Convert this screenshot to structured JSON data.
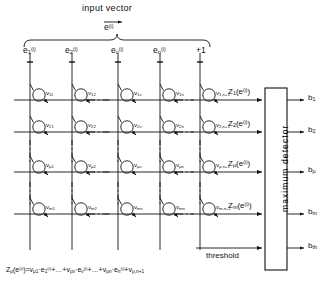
{
  "figure": {
    "title": "input vector",
    "input_vector_symbol": "e",
    "input_vector_sup": "(i)"
  },
  "inputs": [
    {
      "name": "e",
      "sub": "1",
      "sup": "(i)",
      "x": 30
    },
    {
      "name": "e",
      "sub": "2",
      "sup": "(i)",
      "x": 72
    },
    {
      "name": "e",
      "sub": "ν",
      "sup": "(i)",
      "x": 118
    },
    {
      "name": "e",
      "sub": "n",
      "sup": "(i)",
      "x": 160
    },
    {
      "name": "+1",
      "sub": "",
      "sup": "",
      "x": 200
    }
  ],
  "rows": [
    {
      "weights": [
        "v11",
        "v12",
        "v1ν",
        "v1n",
        "v1,n+1"
      ],
      "weight_parts": [
        {
          "base": "v",
          "sub": "11"
        },
        {
          "base": "v",
          "sub": "12"
        },
        {
          "base": "v",
          "sub": "1ν"
        },
        {
          "base": "v",
          "sub": "1n"
        },
        {
          "base": "v",
          "sub": "1,n+1"
        }
      ],
      "z_label": {
        "base": "Z",
        "sub": "1",
        "arg": "(e",
        "sup": "(i)",
        "close": ")"
      },
      "output": {
        "base": "b",
        "sub": "1"
      }
    },
    {
      "weight_parts": [
        {
          "base": "v",
          "sub": "21"
        },
        {
          "base": "v",
          "sub": "22"
        },
        {
          "base": "v",
          "sub": "2ν"
        },
        {
          "base": "v",
          "sub": "2n"
        },
        {
          "base": "v",
          "sub": "2,n+1"
        }
      ],
      "z_label": {
        "base": "Z",
        "sub": "2",
        "arg": "(e",
        "sup": "(i)",
        "close": ")"
      },
      "output": {
        "base": "b",
        "sub": "2"
      }
    },
    {
      "weight_parts": [
        {
          "base": "v",
          "sub": "μ1"
        },
        {
          "base": "v",
          "sub": "μ2"
        },
        {
          "base": "v",
          "sub": "μν"
        },
        {
          "base": "v",
          "sub": "μn"
        },
        {
          "base": "v",
          "sub": "μ,n+1"
        }
      ],
      "z_label": {
        "base": "Z",
        "sub": "μ",
        "arg": "(e",
        "sup": "(i)",
        "close": ")"
      },
      "output": {
        "base": "b",
        "sub": "μ"
      }
    },
    {
      "weight_parts": [
        {
          "base": "v",
          "sub": "m1"
        },
        {
          "base": "v",
          "sub": "m2"
        },
        {
          "base": "v",
          "sub": "mν"
        },
        {
          "base": "v",
          "sub": "mn"
        },
        {
          "base": "v",
          "sub": "m,n+1"
        }
      ],
      "z_label": {
        "base": "Z",
        "sub": "m",
        "arg": "(e",
        "sup": "(i)",
        "close": ")"
      },
      "output": {
        "base": "b",
        "sub": "m"
      }
    }
  ],
  "detector": {
    "label": "maximum detector"
  },
  "threshold": {
    "label": "threshold",
    "output": {
      "base": "b",
      "sub": "th"
    }
  },
  "equation": {
    "lhs_base": "Z",
    "lhs_sub": "μ",
    "lhs_arg": "(e",
    "lhs_sup": "(i)",
    "lhs_close": ")",
    "eq": "=",
    "terms": [
      {
        "w_base": "v",
        "w_sub": "μ1",
        "dot": "·",
        "e_base": "e",
        "e_sub": "1",
        "e_sup": "(i)"
      },
      {
        "w_base": "v",
        "w_sub": "μν",
        "dot": "·",
        "e_base": "e",
        "e_sub": "ν",
        "e_sup": "(i)"
      },
      {
        "w_base": "v",
        "w_sub": "μn",
        "dot": "·",
        "e_base": "e",
        "e_sub": "n",
        "e_sup": "(i)"
      }
    ],
    "plus": "+",
    "ellipsis": "…",
    "last_term": {
      "w_base": "v",
      "w_sub": "μ,n+1"
    }
  },
  "colors": {
    "ink": "#111111",
    "background": "#ffffff"
  }
}
